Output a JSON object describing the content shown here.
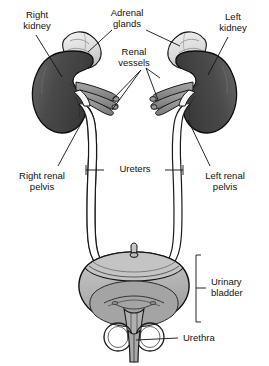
{
  "figure": {
    "background_color": "#ffffff",
    "ink_color": "#111111",
    "kidney_color": "#4a4a4a",
    "adrenal_color": "#e6e6e6",
    "vessel_color": "#8c8c8c",
    "ureter_color": "#ffffff",
    "bladder_color": "#b3b3b3",
    "bladder_lumen_color": "#a0a0a0"
  },
  "labels": {
    "right_kidney": "Right\nkidney",
    "adrenal_glands": "Adrenal\nglands",
    "renal_vessels": "Renal\nvessels",
    "left_kidney": "Left\nkidney",
    "right_renal_pelvis": "Right renal\npelvis",
    "ureters": "Ureters",
    "left_renal_pelvis": "Left renal\npelvis",
    "urinary_bladder": "Urinary\nbladder",
    "urethra": "Urethra"
  },
  "structures": [
    {
      "name": "right-kidney",
      "side": "right",
      "fill": "#4a4a4a"
    },
    {
      "name": "left-kidney",
      "side": "left",
      "fill": "#4a4a4a"
    },
    {
      "name": "right-adrenal-gland",
      "side": "right",
      "fill": "#e6e6e6"
    },
    {
      "name": "left-adrenal-gland",
      "side": "left",
      "fill": "#e6e6e6"
    },
    {
      "name": "right-renal-vessels",
      "side": "right",
      "fill": "#8c8c8c"
    },
    {
      "name": "left-renal-vessels",
      "side": "left",
      "fill": "#8c8c8c"
    },
    {
      "name": "right-ureter",
      "side": "right",
      "fill": "#ffffff"
    },
    {
      "name": "left-ureter",
      "side": "left",
      "fill": "#ffffff"
    },
    {
      "name": "urinary-bladder",
      "side": "center",
      "fill": "#b3b3b3"
    },
    {
      "name": "urethra",
      "side": "center",
      "fill": "#b3b3b3"
    }
  ]
}
